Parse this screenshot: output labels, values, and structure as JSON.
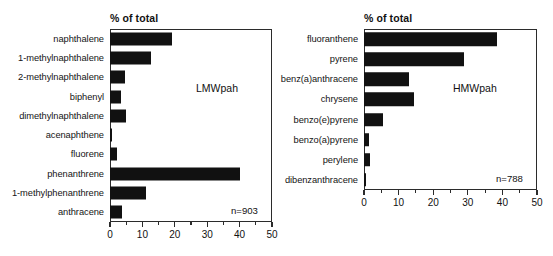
{
  "figure": {
    "panels": [
      {
        "id": "lmw",
        "axis_title": "% of total",
        "series_label": "LMWpah",
        "sample_note": "n=903",
        "xlabel": "",
        "ylabel": "",
        "xlim": [
          0,
          50
        ],
        "xticks": [
          "0",
          "10",
          "20",
          "30",
          "40",
          "50"
        ],
        "xtick_values": [
          0,
          10,
          20,
          30,
          40,
          50
        ],
        "minor_tick_values": [
          5,
          15,
          25,
          35,
          45
        ],
        "categories": [
          "naphthalene",
          "1-methylnaphthalene",
          "2-methylnaphthalene",
          "biphenyl",
          "dimethylnaphthalene",
          "acenaphthene",
          "fluorene",
          "phenanthrene",
          "1-methylphenanthrene",
          "anthracene"
        ],
        "values": [
          19.0,
          12.5,
          4.7,
          3.5,
          4.8,
          0.7,
          2.3,
          40.0,
          11.0,
          3.8
        ]
      },
      {
        "id": "hmw",
        "axis_title": "% of total",
        "series_label": "HMWpah",
        "sample_note": "n=788",
        "xlabel": "",
        "ylabel": "",
        "xlim": [
          0,
          50
        ],
        "xticks": [
          "0",
          "10",
          "20",
          "30",
          "40",
          "50"
        ],
        "xtick_values": [
          0,
          10,
          20,
          30,
          40,
          50
        ],
        "minor_tick_values": [
          5,
          15,
          25,
          35,
          45
        ],
        "categories": [
          "fluoranthene",
          "pyrene",
          "benz(a)anthracene",
          "chrysene",
          "benzo(e)pyrene",
          "benzo(a)pyrene",
          "perylene",
          "dibenzanthracene"
        ],
        "values": [
          38.5,
          29.0,
          13.0,
          14.5,
          5.5,
          1.5,
          1.8,
          0.5
        ]
      }
    ]
  },
  "chart_data": [
    {
      "type": "bar",
      "orientation": "horizontal",
      "title": "LMWpah",
      "subtitle": "",
      "xlabel": "% of total",
      "ylabel": "",
      "xlim": [
        0,
        50
      ],
      "grid": false,
      "legend": "none",
      "annotations": [
        "LMWpah",
        "n=903"
      ],
      "tick_labels": [
        "0",
        "10",
        "20",
        "30",
        "40",
        "50"
      ],
      "categories": [
        "naphthalene",
        "1-methylnaphthalene",
        "2-methylnaphthalene",
        "biphenyl",
        "dimethylnaphthalene",
        "acenaphthene",
        "fluorene",
        "phenanthrene",
        "1-methylphenanthrene",
        "anthracene"
      ],
      "values": [
        19.0,
        12.5,
        4.7,
        3.5,
        4.8,
        0.7,
        2.3,
        40.0,
        11.0,
        3.8
      ]
    },
    {
      "type": "bar",
      "orientation": "horizontal",
      "title": "HMWpah",
      "subtitle": "",
      "xlabel": "% of total",
      "ylabel": "",
      "xlim": [
        0,
        50
      ],
      "grid": false,
      "legend": "none",
      "annotations": [
        "HMWpah",
        "n=788"
      ],
      "tick_labels": [
        "0",
        "10",
        "20",
        "30",
        "40",
        "50"
      ],
      "categories": [
        "fluoranthene",
        "pyrene",
        "benz(a)anthracene",
        "chrysene",
        "benzo(e)pyrene",
        "benzo(a)pyrene",
        "perylene",
        "dibenzanthracene"
      ],
      "values": [
        38.5,
        29.0,
        13.0,
        14.5,
        5.5,
        1.5,
        1.8,
        0.5
      ]
    }
  ]
}
